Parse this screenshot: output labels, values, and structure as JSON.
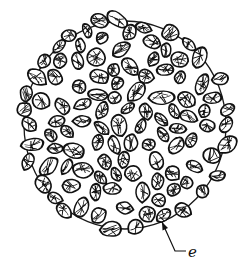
{
  "diagram": {
    "outline": {
      "cx": 125,
      "cy": 125,
      "rx": 101,
      "ry": 104,
      "stroke": "#1a1a1a"
    },
    "grain_stroke": "#111111",
    "background": "#ffffff",
    "grain_count_estimate": 150,
    "label": {
      "text": "e",
      "pointer_from": [
        186,
        251
      ],
      "pointer_bend": [
        175,
        251
      ],
      "pointer_to": [
        162,
        222
      ]
    }
  }
}
